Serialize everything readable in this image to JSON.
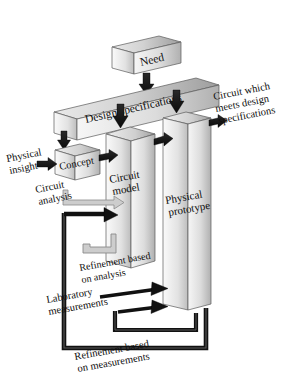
{
  "figure": {
    "background_color": "#ffffff",
    "width": 286,
    "height": 385
  },
  "palette": {
    "block_face_light": "#f2f2f2",
    "block_face_dark": "#b9b9b9",
    "block_top_light": "#e8e8e8",
    "block_top_dark": "#9e9e9e",
    "block_side_dark": "#8d8d8d",
    "outline": "#555555",
    "arrow_dark": "#1a1a1a",
    "arrow_mid": "#3a3a3a",
    "loop_light": "#c9c9c9",
    "loop_light_outline": "#8c8c8c",
    "text_color": "#0d0d0d"
  },
  "blocks": [
    {
      "id": "need",
      "label": "Need",
      "type": "horizontal-bar"
    },
    {
      "id": "design-specs",
      "label": "Design specifications",
      "type": "horizontal-bar"
    },
    {
      "id": "concept",
      "label": "Concept",
      "type": "small-box"
    },
    {
      "id": "circuit-model",
      "label_line1": "Circuit",
      "label_line2": "model",
      "type": "tall-slab"
    },
    {
      "id": "physical-prototype",
      "label_line1": "Physical",
      "label_line2": "prototype",
      "type": "tall-slab"
    }
  ],
  "labels": {
    "need": "Need",
    "design_specifications": "Design specifications",
    "concept": "Concept",
    "circuit_model_l1": "Circuit",
    "circuit_model_l2": "model",
    "physical_prototype_l1": "Physical",
    "physical_prototype_l2": "prototype",
    "physical_insight_l1": "Physical",
    "physical_insight_l2": "insight",
    "circuit_analysis_l1": "Circuit",
    "circuit_analysis_l2": "analysis",
    "output_l1": "Circuit which",
    "output_l2": "meets design",
    "output_l3": "specifications",
    "refinement_analysis_l1": "Refinement based",
    "refinement_analysis_l2": "on analysis",
    "laboratory_l1": "Laboratory",
    "laboratory_l2": "measurements",
    "refinement_measurements_l1": "Refinement based",
    "refinement_measurements_l2": "on measurements"
  },
  "arrows": [
    {
      "id": "need-to-specs",
      "style": "dark-vertical",
      "from": "need",
      "to": "design-specs"
    },
    {
      "id": "specs-to-concept",
      "style": "dark-vertical",
      "from": "design-specs",
      "to": "concept"
    },
    {
      "id": "specs-to-circuit-model",
      "style": "dark-vertical",
      "from": "design-specs",
      "to": "circuit-model"
    },
    {
      "id": "specs-to-prototype",
      "style": "dark-vertical",
      "from": "design-specs",
      "to": "physical-prototype"
    },
    {
      "id": "insight-to-concept",
      "style": "dark-horizontal",
      "from": "physical-insight",
      "to": "concept"
    },
    {
      "id": "concept-to-circuit-model",
      "style": "dark-horizontal",
      "from": "concept",
      "to": "circuit-model"
    },
    {
      "id": "model-to-prototype",
      "style": "dark-horizontal",
      "from": "circuit-model",
      "to": "physical-prototype"
    },
    {
      "id": "prototype-to-output",
      "style": "dark-horizontal",
      "from": "physical-prototype",
      "to": "output"
    },
    {
      "id": "circuit-analysis-loop",
      "style": "light-loop",
      "from": "concept",
      "to": "circuit-model"
    },
    {
      "id": "refinement-analysis-loop",
      "style": "light-loop",
      "from": "circuit-model",
      "to": "circuit-model"
    },
    {
      "id": "laboratory-measurements",
      "style": "dark-horizontal",
      "from": "laboratory",
      "to": "physical-prototype"
    },
    {
      "id": "refinement-measurements-loop",
      "style": "dark-loop",
      "from": "physical-prototype",
      "to": "circuit-model"
    }
  ]
}
